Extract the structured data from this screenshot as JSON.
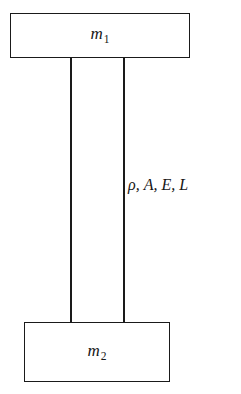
{
  "figure": {
    "type": "mechanical-schematic",
    "background_color": "#ffffff",
    "stroke_color": "#1a1a1a"
  },
  "top_mass": {
    "label_symbol": "m",
    "label_subscript": "1",
    "label_full": "m1"
  },
  "bottom_mass": {
    "label_symbol": "m",
    "label_subscript": "2",
    "label_full": "m2"
  },
  "bar": {
    "properties_label": "ρ, A, E, L",
    "property_symbols": [
      "ρ",
      "A",
      "E",
      "L"
    ]
  }
}
